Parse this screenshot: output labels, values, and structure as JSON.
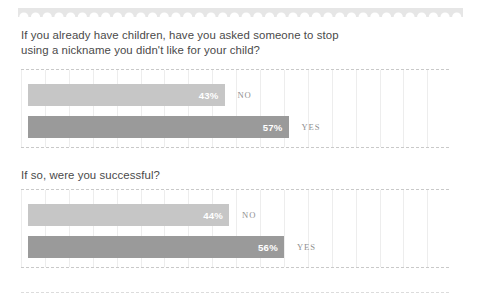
{
  "decor": {
    "scallop_name": "scalloped-top-border",
    "scallop_color": "#e6e6e6",
    "bottom_rule_name": "bottom-dashed-rule"
  },
  "colors": {
    "heading_text": "#4a4a4a",
    "bar_light": "#c6c6c6",
    "bar_dark": "#9a9a9a",
    "value_text": "#ffffff",
    "category_text": "#8f8f8f",
    "gridline": "#ededed",
    "panel_border": "#c9c9c9",
    "background": "#ffffff"
  },
  "sections": [
    {
      "question": "If you already have children, have you asked someone to stop using a nickname you didn't like for your child?",
      "bars": [
        {
          "label": "NO",
          "value": "43%",
          "percent": 43,
          "tone": "light"
        },
        {
          "label": "YES",
          "value": "57%",
          "percent": 57,
          "tone": "dark"
        }
      ]
    },
    {
      "question": "If so, were you successful?",
      "bars": [
        {
          "label": "NO",
          "value": "44%",
          "percent": 44,
          "tone": "light"
        },
        {
          "label": "YES",
          "value": "56%",
          "percent": 56,
          "tone": "dark"
        }
      ]
    }
  ],
  "chart_data": [
    {
      "type": "bar",
      "title": "If you already have children, have you asked someone to stop using a nickname you didn't like for your child?",
      "orientation": "horizontal",
      "categories": [
        "NO",
        "YES"
      ],
      "values": [
        43,
        57
      ],
      "data_labels": [
        "43%",
        "57%"
      ],
      "unit": "percent",
      "xlabel": "",
      "ylabel": "",
      "xlim": [
        0,
        100
      ],
      "grid": true,
      "grid_orientation": "vertical",
      "legend": false,
      "series": [
        {
          "name": "Share of respondents",
          "values": [
            43,
            57
          ]
        }
      ]
    },
    {
      "type": "bar",
      "title": "If so, were you successful?",
      "orientation": "horizontal",
      "categories": [
        "NO",
        "YES"
      ],
      "values": [
        44,
        56
      ],
      "data_labels": [
        "44%",
        "56%"
      ],
      "unit": "percent",
      "xlabel": "",
      "ylabel": "",
      "xlim": [
        0,
        100
      ],
      "grid": true,
      "grid_orientation": "vertical",
      "legend": false,
      "series": [
        {
          "name": "Share of respondents",
          "values": [
            44,
            56
          ]
        }
      ]
    }
  ]
}
